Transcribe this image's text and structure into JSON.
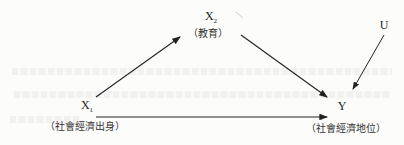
{
  "diagram": {
    "nodes": {
      "x1": {
        "symbol": "X",
        "subscript": "1",
        "label": "（社會經濟出身）"
      },
      "x2": {
        "symbol": "X",
        "subscript": "2",
        "label": "（教育）"
      },
      "u": {
        "symbol": "U",
        "label": ""
      },
      "y": {
        "symbol": "Y",
        "label": "（社會經濟地位）"
      }
    },
    "edges": [
      {
        "from": "X1",
        "to": "X2"
      },
      {
        "from": "X2",
        "to": "Y"
      },
      {
        "from": "U",
        "to": "Y"
      },
      {
        "from": "X1",
        "to": "Y"
      }
    ],
    "colors": {
      "ink": "#222222",
      "background": "#fcfcfb"
    }
  }
}
